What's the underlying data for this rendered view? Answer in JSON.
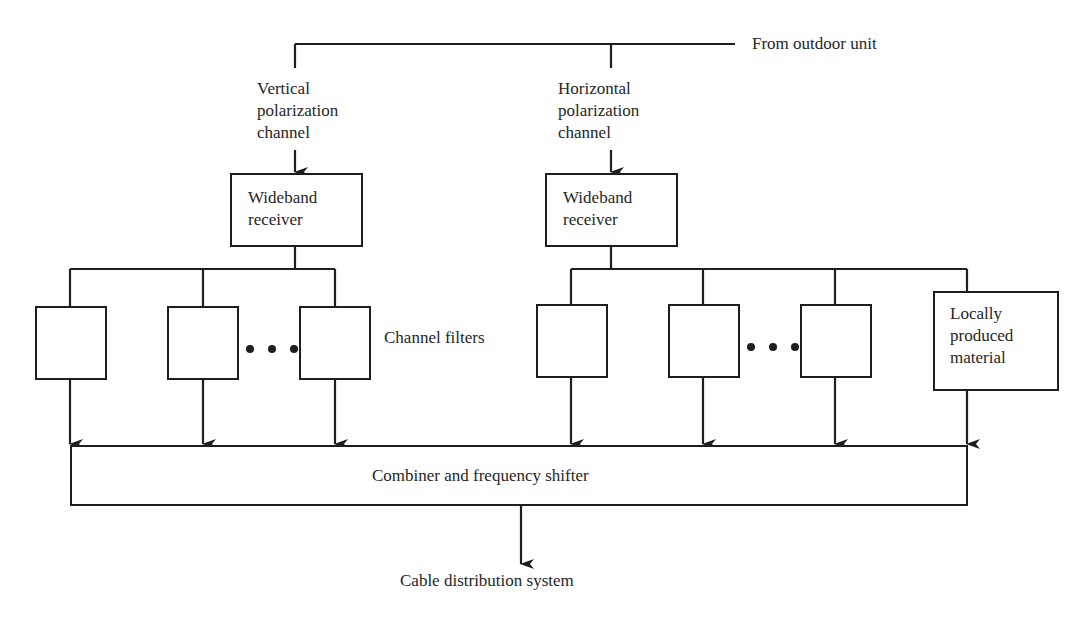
{
  "diagram": {
    "type": "block-diagram",
    "title": "",
    "input_label": "From outdoor unit",
    "channels": [
      {
        "id": "vertical",
        "label": "Vertical\npolarization\nchannel",
        "receiver_label": "Wideband\nreceiver"
      },
      {
        "id": "horizontal",
        "label": "Horizontal\npolarization\nchannel",
        "receiver_label": "Wideband\nreceiver"
      }
    ],
    "filters_label": "Channel filters",
    "local_source_label": "Locally\nproduced\nmaterial",
    "combiner_label": "Combiner and frequency shifter",
    "output_label": "Cable distribution system",
    "ellipsis": "• • •",
    "nodes": [
      {
        "id": "outdoor-unit",
        "label": "From outdoor unit"
      },
      {
        "id": "rx-v",
        "label": "Wideband receiver"
      },
      {
        "id": "rx-h",
        "label": "Wideband receiver"
      },
      {
        "id": "filters-v",
        "label": "Channel filters (3 shown + ellipsis)"
      },
      {
        "id": "filters-h",
        "label": "Channel filters (3 shown + ellipsis)"
      },
      {
        "id": "local",
        "label": "Locally produced material"
      },
      {
        "id": "combiner",
        "label": "Combiner and frequency shifter"
      },
      {
        "id": "output",
        "label": "Cable distribution system"
      }
    ],
    "edges": [
      [
        "outdoor-unit",
        "rx-v"
      ],
      [
        "outdoor-unit",
        "rx-h"
      ],
      [
        "rx-v",
        "filters-v"
      ],
      [
        "rx-h",
        "filters-h"
      ],
      [
        "rx-h",
        "local"
      ],
      [
        "filters-v",
        "combiner"
      ],
      [
        "filters-h",
        "combiner"
      ],
      [
        "local",
        "combiner"
      ],
      [
        "combiner",
        "output"
      ]
    ]
  }
}
